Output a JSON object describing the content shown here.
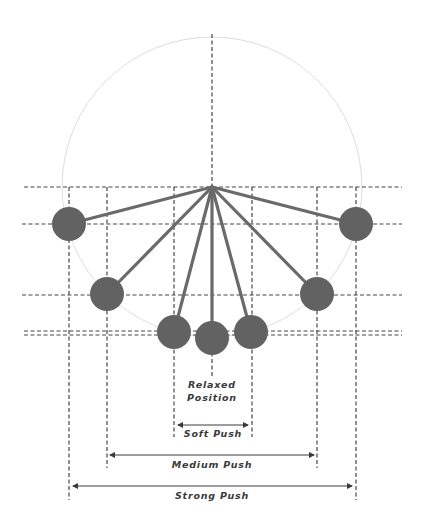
{
  "diagram": {
    "colors": {
      "background": "#ffffff",
      "rod": "#6a6a6a",
      "bob": "#626262",
      "guide_dashed": "#474747",
      "circle": "#dddddd",
      "text": "#3a3a3a"
    },
    "pivot": {
      "x": 212,
      "y": 187
    },
    "circle": {
      "cx": 212,
      "cy": 187,
      "r": 150
    },
    "bobs": [
      {
        "id": "strong-left",
        "x": 69,
        "y": 224
      },
      {
        "id": "medium-left",
        "x": 107,
        "y": 294
      },
      {
        "id": "soft-left",
        "x": 174,
        "y": 332
      },
      {
        "id": "relaxed",
        "x": 212,
        "y": 338
      },
      {
        "id": "soft-right",
        "x": 251,
        "y": 332
      },
      {
        "id": "medium-right",
        "x": 317,
        "y": 294
      },
      {
        "id": "strong-right",
        "x": 356,
        "y": 224
      }
    ],
    "labels": {
      "relaxed_line1": "Relaxed",
      "relaxed_line2": "Position",
      "soft_push": "Soft Push",
      "medium_push": "Medium Push",
      "strong_push": "Strong Push"
    }
  }
}
